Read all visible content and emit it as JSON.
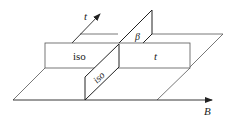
{
  "diagram": {
    "type": "phase-diagram-3d-sketch",
    "colors": {
      "line": "#222222",
      "thin_line": "#555555",
      "background": "#ffffff"
    },
    "axes": {
      "t": {
        "label": "t"
      },
      "B": {
        "label": "B"
      }
    },
    "regions": {
      "band_left": {
        "label": "iso"
      },
      "band_right": {
        "label": "t"
      },
      "panel_lower": {
        "label": "iso"
      },
      "panel_upper": {
        "label": "β"
      }
    }
  }
}
